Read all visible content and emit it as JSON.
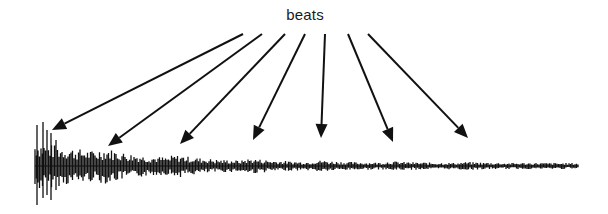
{
  "diagram": {
    "label": "beats",
    "colors": {
      "ink": "#111111",
      "background": "#ffffff"
    },
    "arrows": [
      {
        "from": [
          243,
          34
        ],
        "to": [
          52,
          130
        ]
      },
      {
        "from": [
          262,
          34
        ],
        "to": [
          108,
          146
        ]
      },
      {
        "from": [
          285,
          34
        ],
        "to": [
          180,
          144
        ]
      },
      {
        "from": [
          305,
          34
        ],
        "to": [
          253,
          140
        ]
      },
      {
        "from": [
          325,
          34
        ],
        "to": [
          321,
          138
        ]
      },
      {
        "from": [
          348,
          34
        ],
        "to": [
          393,
          142
        ]
      },
      {
        "from": [
          368,
          34
        ],
        "to": [
          468,
          138
        ]
      }
    ],
    "waveform": {
      "x_start": 35,
      "x_end": 578,
      "baseline_y": 166,
      "onset_peaks": [
        {
          "x": 37,
          "top": 125,
          "bottom": 205
        },
        {
          "x": 43,
          "top": 122,
          "bottom": 198
        },
        {
          "x": 47,
          "top": 130,
          "bottom": 195
        },
        {
          "x": 51,
          "top": 133,
          "bottom": 200
        },
        {
          "x": 56,
          "top": 140,
          "bottom": 190
        }
      ],
      "decay": "exponential"
    }
  }
}
